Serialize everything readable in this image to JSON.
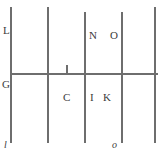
{
  "figure": {
    "type": "line-diagram",
    "width": 163,
    "height": 150,
    "background_color": "#ffffff",
    "stroke_color": "#707070",
    "label_color": "#3b3b3b"
  },
  "lines": {
    "vertical": [
      {
        "name": "line-L-G-l",
        "x": 11,
        "y1": 7,
        "y2": 143,
        "stroke": "#6e6e6e",
        "width": 1.4
      },
      {
        "name": "line-second",
        "x": 48,
        "y1": 7,
        "y2": 143,
        "stroke": "#6e6e6e",
        "width": 1.4
      },
      {
        "name": "line-N-I",
        "x": 85,
        "y1": 12,
        "y2": 143,
        "stroke": "#6e6e6e",
        "width": 1.4
      },
      {
        "name": "line-O-K-o",
        "x": 122,
        "y1": 12,
        "y2": 143,
        "stroke": "#6e6e6e",
        "width": 1.4
      },
      {
        "name": "line-right",
        "x": 155,
        "y1": 7,
        "y2": 143,
        "stroke": "#6e6e6e",
        "width": 1.4
      }
    ],
    "horizontal": [
      {
        "name": "line-G-horizontal",
        "y": 74,
        "x1": 11,
        "x2": 158,
        "stroke": "#6e6e6e",
        "width": 1.4
      }
    ],
    "ticks": [
      {
        "name": "tick-C",
        "x": 67,
        "y1": 65,
        "y2": 74,
        "stroke": "#6e6e6e",
        "width": 1.4
      }
    ]
  },
  "labels": [
    {
      "name": "label-L",
      "text": "L",
      "x": 3,
      "y": 25,
      "style": "upright"
    },
    {
      "name": "label-N",
      "text": "N",
      "x": 89,
      "y": 30,
      "style": "upright"
    },
    {
      "name": "label-O",
      "text": "O",
      "x": 110,
      "y": 30,
      "style": "upright"
    },
    {
      "name": "label-G",
      "text": "G",
      "x": 2,
      "y": 79,
      "style": "upright"
    },
    {
      "name": "label-C",
      "text": "C",
      "x": 63,
      "y": 92,
      "style": "upright"
    },
    {
      "name": "label-I",
      "text": "I",
      "x": 90,
      "y": 92,
      "style": "upright"
    },
    {
      "name": "label-K",
      "text": "K",
      "x": 103,
      "y": 92,
      "style": "upright"
    },
    {
      "name": "label-l",
      "text": "l",
      "x": 4,
      "y": 139,
      "style": "italic"
    },
    {
      "name": "label-o",
      "text": "o",
      "x": 112,
      "y": 139,
      "style": "italic"
    }
  ]
}
